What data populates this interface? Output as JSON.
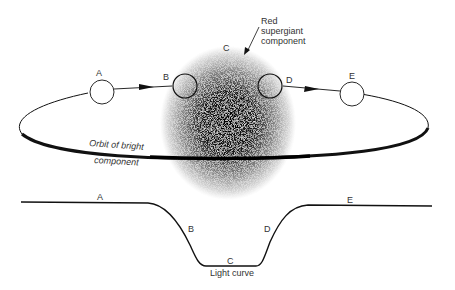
{
  "diagram": {
    "title_label": {
      "line1": "Red",
      "line2": "supergiant",
      "line3": "component"
    },
    "orbit_label": {
      "line1": "Orbit of bright",
      "line2": "component"
    },
    "positions": [
      "A",
      "B",
      "C",
      "D",
      "E"
    ],
    "light_curve_label": "Light curve",
    "curve_labels": [
      "A",
      "B",
      "C",
      "D",
      "E"
    ],
    "colors": {
      "ink": "#111111",
      "text": "#333333",
      "background": "#ffffff"
    }
  }
}
